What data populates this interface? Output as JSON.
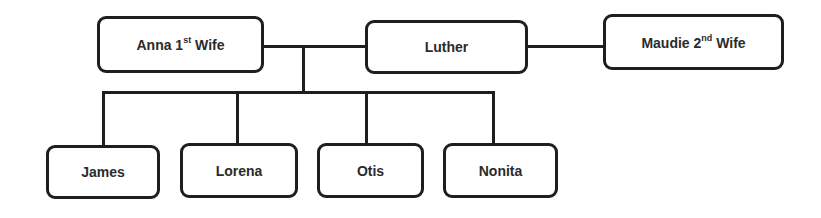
{
  "diagram": {
    "type": "family-tree",
    "parents": [
      {
        "id": "anna",
        "name": "Anna 1",
        "sup": "st",
        "suffix": " Wife"
      },
      {
        "id": "luther",
        "name": "Luther",
        "sup": "",
        "suffix": ""
      },
      {
        "id": "maudie",
        "name": "Maudie 2",
        "sup": "nd",
        "suffix": " Wife"
      }
    ],
    "children": [
      {
        "id": "james",
        "name": "James"
      },
      {
        "id": "lorena",
        "name": "Lorena"
      },
      {
        "id": "otis",
        "name": "Otis"
      },
      {
        "id": "nonita",
        "name": "Nonita"
      }
    ],
    "edges": [
      {
        "from": "anna",
        "to": "luther",
        "type": "marriage"
      },
      {
        "from": "luther",
        "to": "maudie",
        "type": "marriage"
      },
      {
        "from": "anna-luther",
        "to": [
          "james",
          "lorena",
          "otis",
          "nonita"
        ],
        "type": "children"
      }
    ],
    "colors": {
      "stroke": "#1e1e1e",
      "text": "#2b2b2b",
      "background": "#ffffff"
    }
  }
}
